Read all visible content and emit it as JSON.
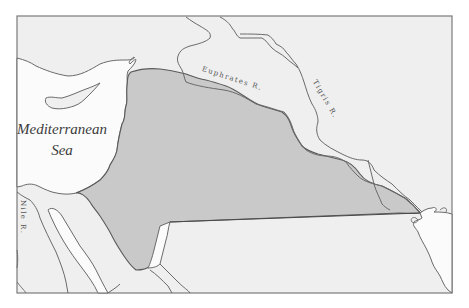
{
  "map": {
    "labels": {
      "sea_line1": "Mediterranean",
      "sea_line2": "Sea",
      "euphrates": "Euphrates R.",
      "tigris": "Tigris R.",
      "nile": "Nile R."
    },
    "colors": {
      "background": "#ffffff",
      "land": "#efefef",
      "sea": "#fbfbfb",
      "highlighted_region": "#c9c9c9",
      "borders": "#6a6a6a",
      "frame": "#7a7a7a"
    }
  }
}
